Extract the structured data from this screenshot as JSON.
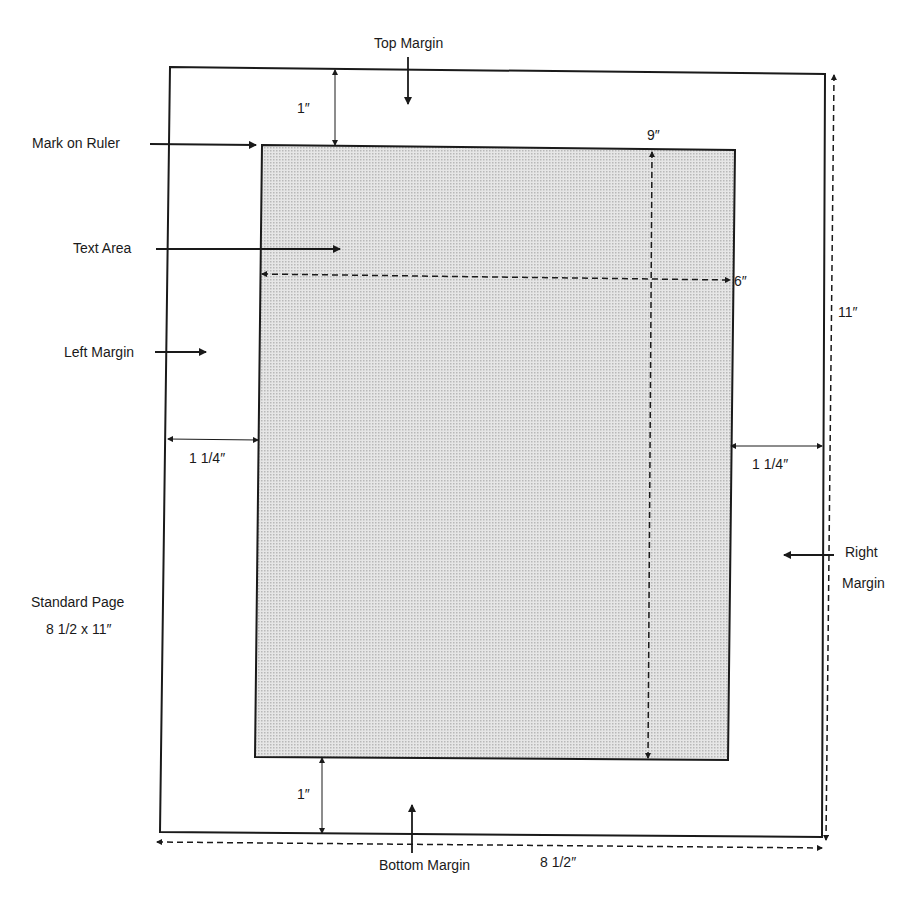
{
  "title": "Standard Page",
  "page_size": "8 1/2 x 11″",
  "labels": {
    "top_margin": "Top Margin",
    "mark_on_ruler": "Mark on Ruler",
    "text_area": "Text Area",
    "left_margin": "Left Margin",
    "right_margin_line1": "Right",
    "right_margin_line2": "Margin",
    "bottom_margin": "Bottom Margin",
    "standard_page_line1": "Standard Page",
    "standard_page_line2": "8 1/2 x 11″"
  },
  "dimensions": {
    "top": "1″",
    "bottom": "1″",
    "left": "1 1/4″",
    "right": "1 1/4″",
    "text_height": "9″",
    "text_width": "6″",
    "page_height": "11″",
    "page_width": "8 1/2″"
  },
  "colors": {
    "line": "#1a1a1a",
    "text_area_fill": "#d9d9d9",
    "background": "#ffffff"
  }
}
